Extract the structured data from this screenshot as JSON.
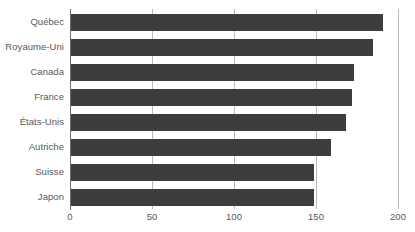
{
  "chart_data": {
    "type": "bar",
    "orientation": "horizontal",
    "title": "",
    "subtitle": "",
    "xlabel": "",
    "ylabel": "",
    "categories": [
      "Québec",
      "Royaume-Uni",
      "Canada",
      "France",
      "États-Unis",
      "Autriche",
      "Suisse",
      "Japon"
    ],
    "values": [
      191,
      185,
      173,
      172,
      168,
      159,
      149,
      149
    ],
    "xlim": [
      0,
      200
    ],
    "xticks": [
      0,
      50,
      100,
      150,
      200
    ],
    "xtick_labels": [
      "0",
      "50",
      "100",
      "150",
      "200"
    ],
    "grid": true,
    "grid_axis": "x",
    "legend": false,
    "series": [
      {
        "name": "",
        "values": [
          191,
          185,
          173,
          172,
          168,
          159,
          149,
          149
        ]
      }
    ]
  },
  "style": {
    "bar_color": "#3d3d3d",
    "gridline_color": "#b9b9bb",
    "axis_color": "#6e6e70",
    "label_color": "#58585a",
    "background": "#ffffff"
  }
}
